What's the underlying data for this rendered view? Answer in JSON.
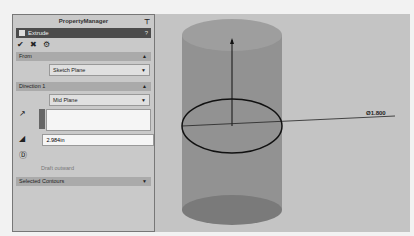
{
  "property_manager": {
    "title": "PropertyManager",
    "pin_icon": "pushpin-icon",
    "feature": {
      "label": "Extrude",
      "icon": "extrude-icon",
      "help": "?"
    },
    "actions": [
      {
        "name": "ok",
        "glyph": "✔"
      },
      {
        "name": "cancel",
        "glyph": "✖"
      },
      {
        "name": "preview",
        "glyph": "⚙"
      }
    ],
    "from_section": {
      "title": "From",
      "value": "Sketch Plane"
    },
    "direction_section": {
      "title": "Direction 1",
      "end_condition": "Mid Plane",
      "depth": "2.984in"
    },
    "draft_label": "Draft outward",
    "selected_contours": "Selected Contours",
    "collapse_glyph": "⌃",
    "expand_glyph": "⌄"
  },
  "viewport": {
    "dimension_label": "Ø1.800",
    "colors": {
      "cylinder": "#8a8a8a",
      "background": "#c4c4c4"
    }
  }
}
